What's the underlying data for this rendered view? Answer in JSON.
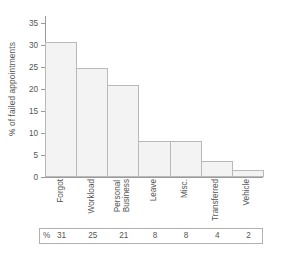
{
  "chart_data": {
    "type": "bar",
    "title": "",
    "subtitle": "",
    "xlabel": "",
    "ylabel": "% of failed appointments",
    "categories": [
      "Forgot",
      "Workload",
      "Personal Business",
      "Leave",
      "Misc.",
      "Transferred",
      "Vehicle"
    ],
    "category_lines": [
      [
        "Forgot"
      ],
      [
        "Workload"
      ],
      [
        "Personal",
        "Business"
      ],
      [
        "Leave"
      ],
      [
        "Misc."
      ],
      [
        "Transferred"
      ],
      [
        "Vehicle"
      ]
    ],
    "values": [
      30.5,
      24.7,
      20.8,
      8.1,
      8.1,
      3.6,
      1.7
    ],
    "ylim": [
      0,
      36.5
    ],
    "yticks": [
      0,
      5,
      10,
      15,
      20,
      25,
      30,
      35
    ],
    "ytick_labels": [
      "0",
      "5",
      "10",
      "15",
      "20",
      "25",
      "30",
      "35"
    ],
    "grid": false,
    "legend": "none",
    "bar_fill_color": "#f3f3f3",
    "bar_edge_color": "#b9b9b9",
    "axis_color": "#9a9a9a",
    "background_color": "#ffffff",
    "bars_adjacent": true,
    "xtick_label_rotation": 90
  },
  "data_table": {
    "row_prefix": "%",
    "values": [
      "31",
      "25",
      "21",
      "8",
      "8",
      "4",
      "2"
    ],
    "border_color": "#b0b0b0"
  }
}
